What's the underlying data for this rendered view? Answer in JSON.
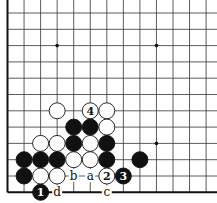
{
  "diagram": {
    "grid": {
      "columns": 13,
      "rows": 12,
      "x0": 7.5,
      "y0": 13,
      "dx": 16.55,
      "dy": 16.3,
      "line_color": "#333333",
      "edge_color": "#111111"
    },
    "star_points": [
      {
        "col": 3,
        "row": 2
      },
      {
        "col": 9,
        "row": 2
      },
      {
        "col": 9,
        "row": 8
      }
    ],
    "stones": [
      {
        "col": 3,
        "row": 6,
        "color": "white"
      },
      {
        "col": 5,
        "row": 6,
        "color": "white",
        "label": "4"
      },
      {
        "col": 6,
        "row": 6,
        "color": "white"
      },
      {
        "col": 4,
        "row": 7,
        "color": "black"
      },
      {
        "col": 5,
        "row": 7,
        "color": "black"
      },
      {
        "col": 6,
        "row": 7,
        "color": "white"
      },
      {
        "col": 2,
        "row": 8,
        "color": "white"
      },
      {
        "col": 3,
        "row": 8,
        "color": "white"
      },
      {
        "col": 4,
        "row": 8,
        "color": "black"
      },
      {
        "col": 5,
        "row": 8,
        "color": "white"
      },
      {
        "col": 6,
        "row": 8,
        "color": "black"
      },
      {
        "col": 1,
        "row": 9,
        "color": "black"
      },
      {
        "col": 2,
        "row": 9,
        "color": "black"
      },
      {
        "col": 3,
        "row": 9,
        "color": "black"
      },
      {
        "col": 4,
        "row": 9,
        "color": "white"
      },
      {
        "col": 5,
        "row": 9,
        "color": "white"
      },
      {
        "col": 6,
        "row": 9,
        "color": "black"
      },
      {
        "col": 8,
        "row": 9,
        "color": "black"
      },
      {
        "col": 1,
        "row": 10,
        "color": "black"
      },
      {
        "col": 2,
        "row": 10,
        "color": "white"
      },
      {
        "col": 3,
        "row": 10,
        "color": "white"
      },
      {
        "col": 6,
        "row": 10,
        "color": "white",
        "label": "2"
      },
      {
        "col": 7,
        "row": 10,
        "color": "black",
        "label": "3"
      },
      {
        "col": 2,
        "row": 11,
        "color": "black",
        "label": "1"
      }
    ],
    "point_labels": [
      {
        "col": 4,
        "row": 10,
        "text": "b"
      },
      {
        "col": 5,
        "row": 10,
        "text": "a"
      },
      {
        "col": 3,
        "row": 11,
        "text": "d"
      },
      {
        "col": 6,
        "row": 11,
        "text": "c"
      }
    ]
  }
}
